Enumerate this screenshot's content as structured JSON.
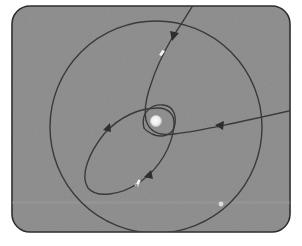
{
  "diagram": {
    "title": "",
    "frame": {
      "fill": "#8b8b8b",
      "stroke": "#2a2a2a"
    },
    "central_body": {
      "label": "central body",
      "color": "#f2f2f2",
      "cx": 156,
      "cy": 121,
      "r": 5
    },
    "orbits": [
      {
        "name": "outer-circular-orbit",
        "type": "circle"
      },
      {
        "name": "inner-orbit",
        "type": "ellipse"
      },
      {
        "name": "transfer-orbit",
        "type": "ellipse"
      },
      {
        "name": "hyperbolic-trajectory",
        "type": "hyperbola"
      }
    ],
    "markers": [
      {
        "name": "spacecraft-incoming",
        "x": 162,
        "y": 53
      },
      {
        "name": "spacecraft-transfer",
        "x": 138,
        "y": 183
      },
      {
        "name": "satellite-outer",
        "x": 221,
        "y": 204
      }
    ],
    "line_color": "#3a3a3a"
  }
}
